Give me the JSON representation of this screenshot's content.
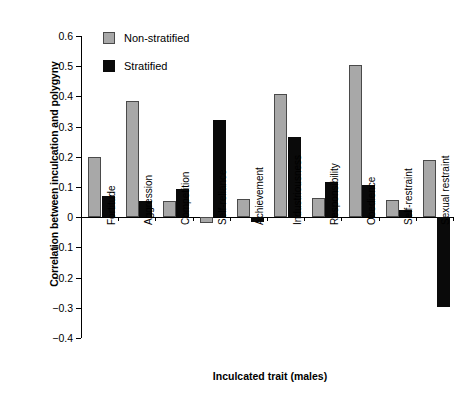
{
  "chart_data": {
    "type": "bar",
    "title": "",
    "xlabel": "Inculcated trait (males)",
    "ylabel": "Correlation between inculcation and polygyny",
    "categories": [
      "Fortitude",
      "Aggression",
      "Competition",
      "Self-reliance",
      "Achievement",
      "Industriousness",
      "Responsibility",
      "Obedience",
      "Self-restraint",
      "Sexual restraint"
    ],
    "series": [
      {
        "name": "Non-stratified",
        "color": "#a8a8a8",
        "values": [
          0.2,
          0.385,
          0.053,
          -0.018,
          0.06,
          0.407,
          0.062,
          0.505,
          0.057,
          0.188
        ]
      },
      {
        "name": "Stratified",
        "color": "#0a0a0a",
        "values": [
          0.07,
          0.053,
          0.095,
          0.322,
          -0.015,
          0.265,
          0.118,
          0.105,
          0.025,
          -0.298
        ]
      }
    ],
    "ylim": [
      -0.4,
      0.6
    ],
    "ytick_labels": [
      "0.6",
      "0.5",
      "0.4",
      "0.3",
      "0.2",
      "0.1",
      "0",
      "−0.1",
      "−0.2",
      "−0.3",
      "−0.4"
    ],
    "ytick_values": [
      0.6,
      0.5,
      0.4,
      0.3,
      0.2,
      0.1,
      0,
      -0.1,
      -0.2,
      -0.3,
      -0.4
    ],
    "grid": false,
    "legend_position": "top-left"
  },
  "legend": {
    "entries": [
      {
        "label": "Non-stratified"
      },
      {
        "label": "Stratified"
      }
    ]
  }
}
